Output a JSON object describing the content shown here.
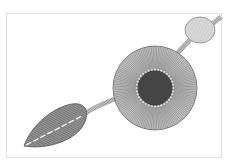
{
  "illustration": {
    "subject": "flower with stem and leaf line-art",
    "colors": {
      "background": "#ffffff",
      "frame": "#e4e4e4",
      "line": "#555555",
      "leaf_fill": "#8a8a8a",
      "petal_fill": "#b5b5b5",
      "center_fill": "#4a4a4a",
      "bud_fill": "#d6d6d6",
      "bead": "#dddddd"
    }
  }
}
